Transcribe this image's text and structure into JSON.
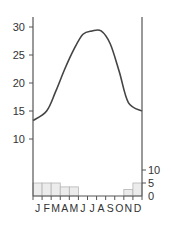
{
  "chart_data": [
    {
      "type": "line",
      "title": "",
      "xlabel": "",
      "ylabel": "",
      "categories": [
        "J",
        "F",
        "M",
        "A",
        "M",
        "J",
        "J",
        "A",
        "S",
        "O",
        "N",
        "D"
      ],
      "series": [
        {
          "name": "Temperature",
          "values": [
            13.3,
            15.0,
            18.5,
            22.5,
            26.0,
            28.7,
            29.3,
            29.3,
            27.0,
            22.0,
            16.5,
            15.0
          ]
        }
      ],
      "ylim": [
        0,
        31
      ],
      "yticks": [
        10,
        15,
        20,
        25,
        30
      ],
      "axis": "left",
      "color": "#444444"
    },
    {
      "type": "bar",
      "title": "",
      "xlabel": "",
      "ylabel": "",
      "categories": [
        "J",
        "F",
        "M",
        "A",
        "M",
        "J",
        "J",
        "A",
        "S",
        "O",
        "N",
        "D"
      ],
      "values": [
        5,
        5,
        5,
        3.5,
        3.5,
        0,
        0,
        0,
        0,
        0,
        2.5,
        5
      ],
      "ylim": [
        0,
        10
      ],
      "yticks": [
        0,
        5,
        10
      ],
      "axis": "right",
      "bar_fill": "#ececec",
      "bar_stroke": "#b5b5b5"
    }
  ],
  "axes": {
    "left_ticks": [
      "30",
      "25",
      "20",
      "15",
      "10"
    ],
    "right_ticks": [
      "10",
      "5",
      "0"
    ],
    "months": [
      "J",
      "F",
      "M",
      "A",
      "M",
      "J",
      "J",
      "A",
      "S",
      "O",
      "N",
      "D"
    ]
  }
}
